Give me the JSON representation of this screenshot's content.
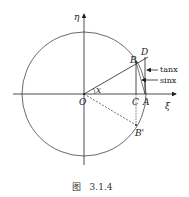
{
  "diagram": {
    "axes": {
      "x_label": "ξ",
      "y_label": "η"
    },
    "points": {
      "O": "O",
      "A": "A",
      "B": "B",
      "B_prime": "B'",
      "C": "C",
      "D": "D"
    },
    "angle_label": "x",
    "annotations": {
      "tan": "tanx",
      "sin": "sinx"
    },
    "caption": "图   3.1.4"
  }
}
